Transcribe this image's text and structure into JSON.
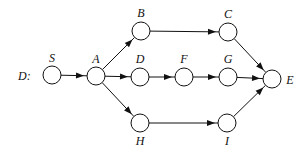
{
  "graph": {
    "title": "D:",
    "nodes": [
      {
        "id": "S",
        "label": "S",
        "x": 52,
        "y": 75,
        "lx": 52,
        "ly": 62
      },
      {
        "id": "A",
        "label": "A",
        "x": 96,
        "y": 76,
        "lx": 96,
        "ly": 63
      },
      {
        "id": "B",
        "label": "B",
        "x": 141,
        "y": 31,
        "lx": 141,
        "ly": 17
      },
      {
        "id": "D",
        "label": "D",
        "x": 140,
        "y": 77,
        "lx": 140,
        "ly": 63
      },
      {
        "id": "H",
        "label": "H",
        "x": 140,
        "y": 123,
        "lx": 140,
        "ly": 145
      },
      {
        "id": "C",
        "label": "C",
        "x": 228,
        "y": 32,
        "lx": 228,
        "ly": 18
      },
      {
        "id": "F",
        "label": "F",
        "x": 184,
        "y": 77,
        "lx": 184,
        "ly": 63
      },
      {
        "id": "G",
        "label": "G",
        "x": 228,
        "y": 77,
        "lx": 228,
        "ly": 63
      },
      {
        "id": "I",
        "label": "I",
        "x": 227,
        "y": 123,
        "lx": 227,
        "ly": 145
      },
      {
        "id": "E",
        "label": "E",
        "x": 272,
        "y": 79,
        "lx": 290,
        "ly": 84
      }
    ],
    "edges": [
      [
        "S",
        "A"
      ],
      [
        "A",
        "B"
      ],
      [
        "A",
        "D"
      ],
      [
        "A",
        "H"
      ],
      [
        "B",
        "C"
      ],
      [
        "D",
        "F"
      ],
      [
        "F",
        "G"
      ],
      [
        "H",
        "I"
      ],
      [
        "C",
        "E"
      ],
      [
        "G",
        "E"
      ],
      [
        "I",
        "E"
      ]
    ]
  }
}
